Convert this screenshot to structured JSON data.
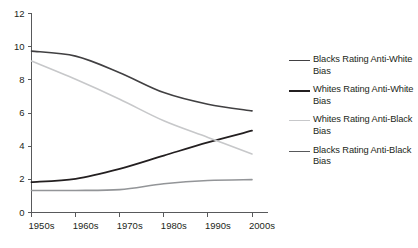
{
  "chart_data": {
    "type": "line",
    "title": "",
    "xlabel": "",
    "ylabel": "",
    "categories": [
      "1950s",
      "1960s",
      "1970s",
      "1980s",
      "1990s",
      "2000s"
    ],
    "ylim": [
      0,
      12
    ],
    "yticks": [
      0,
      2,
      4,
      6,
      8,
      10,
      12
    ],
    "grid": false,
    "legend_position": "right",
    "series": [
      {
        "name": "Blacks Rating Anti-White Bias",
        "color": "#414042",
        "width": 1.6,
        "values": [
          9.7,
          9.4,
          8.4,
          7.2,
          6.5,
          6.1
        ]
      },
      {
        "name": "Whites Rating Anti-White Bias",
        "color": "#231f20",
        "width": 1.8,
        "values": [
          1.8,
          2.0,
          2.6,
          3.4,
          4.2,
          4.9
        ]
      },
      {
        "name": "Whites Rating Anti-Black Bias",
        "color": "#c7c8ca",
        "width": 1.6,
        "values": [
          9.1,
          8.0,
          6.8,
          5.5,
          4.5,
          3.5
        ]
      },
      {
        "name": "Blacks Rating Anti-Black Bias",
        "color": "#939598",
        "width": 1.6,
        "values": [
          1.3,
          1.3,
          1.35,
          1.7,
          1.9,
          1.95
        ]
      }
    ]
  },
  "legend": {
    "items": [
      {
        "label": "Blacks Rating Anti-White Bias",
        "color": "#414042",
        "width": 1.6
      },
      {
        "label": "Whites Rating Anti-White Bias",
        "color": "#231f20",
        "width": 2.0
      },
      {
        "label": "Whites Rating Anti-Black Bias",
        "color": "#c7c8ca",
        "width": 1.6
      },
      {
        "label": "Blacks Rating Anti-Black Bias",
        "color": "#58595b",
        "width": 1.8
      }
    ]
  },
  "axes": {
    "y_tick_labels": [
      "12",
      "10",
      "8",
      "6",
      "4",
      "2",
      "0"
    ],
    "x_tick_labels": [
      "1950s",
      "1960s",
      "1970s",
      "1980s",
      "1990s",
      "2000s"
    ],
    "axis_color": "#58595b"
  }
}
